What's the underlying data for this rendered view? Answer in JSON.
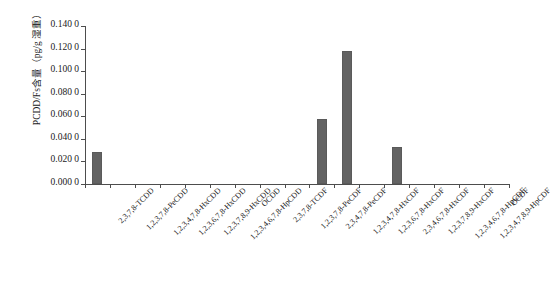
{
  "chart_data": {
    "type": "bar",
    "title": "",
    "xlabel": "",
    "ylabel": "PCDD/Fs含量（pg/g 湿重）",
    "ylim": [
      0,
      0.14
    ],
    "ytick_step": 0.02,
    "ytick_labels": [
      "0.000 0",
      "0.020 0",
      "0.040 0",
      "0.060 0",
      "0.080 0",
      "0.100 0",
      "0.120 0",
      "0.140 0"
    ],
    "ytick_values": [
      0.0,
      0.02,
      0.04,
      0.06,
      0.08,
      0.1,
      0.12,
      0.14
    ],
    "grid": false,
    "legend": "none",
    "bar_color": "#636363",
    "axis_color": "#4d4d4d",
    "categories": [
      "2,3,7,8-TCDD",
      "1,2,3,7,8-PeCDD",
      "1,2,3,4,7,8-HxCDD",
      "1,2,3,6,7,8-HxCDD",
      "1,2,3,7,8,9-HxCDD",
      "1,2,3,4,6,7,8-HpCDD",
      "OCDD",
      "2,3,7,8-TCDF",
      "1,2,3,7,8-PeCDF",
      "2,3,4,7,8-PeCDF",
      "1,2,3,4,7,8-HxCDF",
      "1,2,3,6,7,8-HxCDF",
      "2,3,4,6,7,8-HxCDF",
      "1,2,3,7,8,9-HxCDF",
      "1,2,3,4,6,7,8-HpCDF",
      "1,2,3,4,7,8,9-HpCDF",
      "OCDF"
    ],
    "values": [
      0.028,
      0.0,
      0.0,
      0.0,
      0.0,
      0.0,
      0.0,
      0.0,
      0.0,
      0.058,
      0.118,
      0.0,
      0.033,
      0.0,
      0.0,
      0.0,
      0.0
    ]
  }
}
